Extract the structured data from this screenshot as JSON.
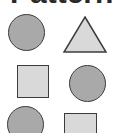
{
  "title": "Pattern",
  "colors": {
    "dark_fill": "#a9a9a9",
    "light_fill": "#d9d9d9",
    "stroke": "#3c3c3c"
  },
  "shapes": [
    {
      "row": 1,
      "col": 1,
      "type": "circle",
      "fill": "dark"
    },
    {
      "row": 1,
      "col": 2,
      "type": "triangle",
      "fill": "light"
    },
    {
      "row": 2,
      "col": 1,
      "type": "square",
      "fill": "light"
    },
    {
      "row": 2,
      "col": 2,
      "type": "circle",
      "fill": "dark"
    },
    {
      "row": 3,
      "col": 1,
      "type": "circle",
      "fill": "dark"
    },
    {
      "row": 3,
      "col": 2,
      "type": "square",
      "fill": "light"
    }
  ]
}
